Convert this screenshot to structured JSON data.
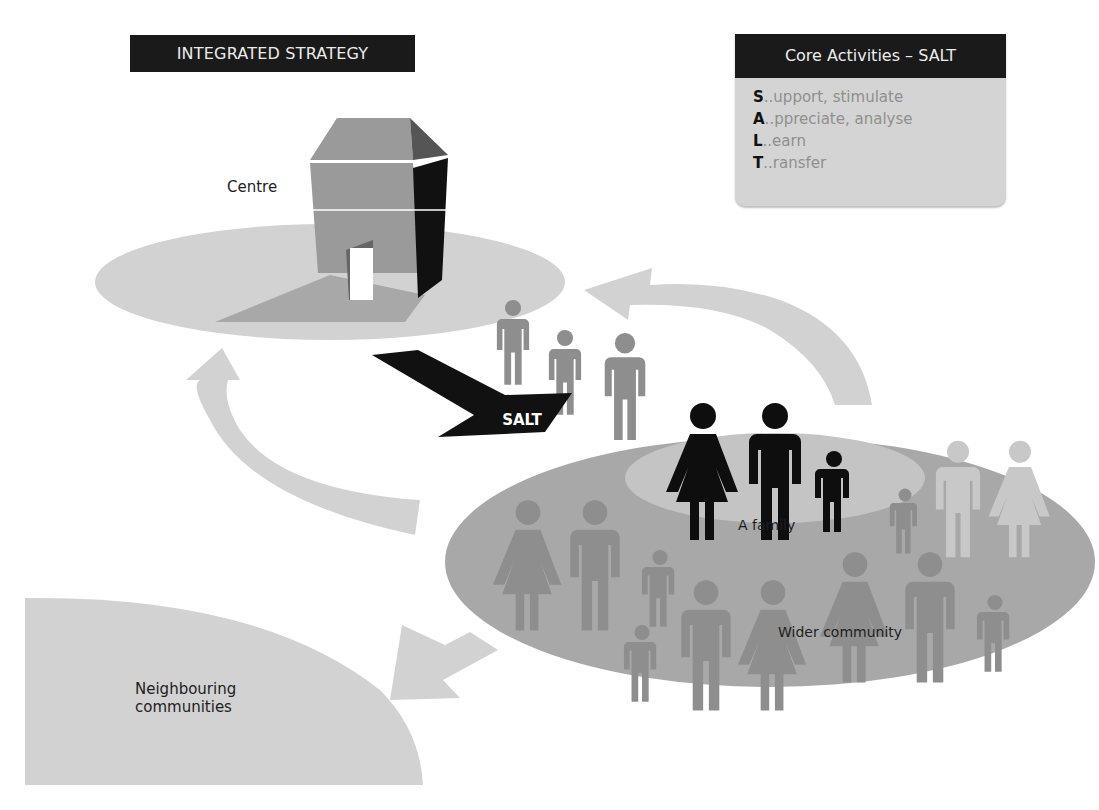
{
  "diagram": {
    "title": "INTEGRATED STRATEGY",
    "core_activities": {
      "header": "Core Activities – SALT",
      "items": [
        {
          "letter": "S",
          "rest": "..upport, stimulate"
        },
        {
          "letter": "A",
          "rest": "..ppreciate, analyse"
        },
        {
          "letter": "L",
          "rest": "..earn"
        },
        {
          "letter": "T",
          "rest": "..ransfer"
        }
      ]
    },
    "nodes": {
      "centre": "Centre",
      "family": "A family",
      "wider_community": "Wider community",
      "neighbouring_line1": "Neighbouring",
      "neighbouring_line2": "communities"
    },
    "arrow_label": "SALT",
    "colors": {
      "dark": "#1a1a1a",
      "light_gray": "#d2d2d2",
      "mid_gray": "#a8a8a8",
      "figure_gray": "#8e8e8e",
      "box_gray": "#d4d4d4"
    }
  }
}
